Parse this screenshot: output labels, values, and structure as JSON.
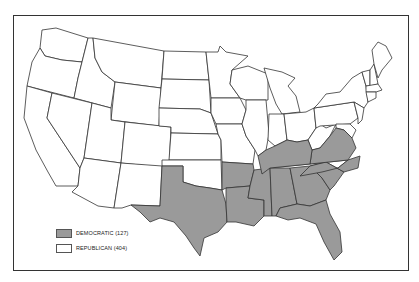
{
  "map": {
    "subject": "United States electoral map",
    "colors": {
      "democratic": "#9a9a9a",
      "republican": "#ffffff",
      "border": "#333333"
    },
    "legend": [
      {
        "party": "democratic",
        "label": "DEMOCRATIC (127)",
        "electoral_votes": 127
      },
      {
        "party": "republican",
        "label": "REPUBLICAN (404)",
        "electoral_votes": 404
      }
    ],
    "democratic_states": [
      "Texas",
      "Arkansas",
      "Louisiana",
      "Mississippi",
      "Alabama",
      "Georgia",
      "Florida",
      "South Carolina",
      "North Carolina",
      "Virginia",
      "Kentucky"
    ],
    "republican_states_note": "All other states shown unshaded"
  }
}
